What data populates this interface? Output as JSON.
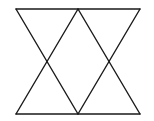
{
  "diagram": {
    "width": 154,
    "height": 121,
    "stroke_color": "#1a1a1a",
    "stroke_width": 1.4,
    "background": "#ffffff",
    "points": {
      "A": [
        16,
        9
      ],
      "B": [
        78,
        9
      ],
      "C": [
        140,
        9
      ],
      "D": [
        16,
        114
      ],
      "E": [
        78,
        114
      ],
      "F": [
        140,
        114
      ]
    },
    "segments": [
      {
        "name": "top-edge",
        "from": "A",
        "to": "C"
      },
      {
        "name": "bottom-edge",
        "from": "D",
        "to": "F"
      },
      {
        "name": "diagonal-a-e",
        "from": "A",
        "to": "E"
      },
      {
        "name": "diagonal-b-d",
        "from": "B",
        "to": "D"
      },
      {
        "name": "diagonal-b-f",
        "from": "B",
        "to": "F"
      },
      {
        "name": "diagonal-c-e",
        "from": "C",
        "to": "E"
      }
    ]
  }
}
